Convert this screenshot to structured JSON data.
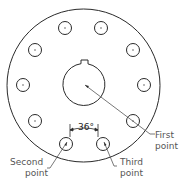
{
  "diagram": {
    "colors": {
      "line": "#2a2a2a",
      "leader": "#555555",
      "text": "#555555",
      "background": "#ffffff"
    },
    "outer_circle": {
      "cx": 83.5,
      "cy": 85.5,
      "r": 76.5
    },
    "center_bore": {
      "cx": 84,
      "cy": 84.5,
      "r": 21,
      "keyway": {
        "x1": 81,
        "x2": 88,
        "top": 60
      }
    },
    "holes": [
      {
        "cx": 65,
        "cy": 28
      },
      {
        "cx": 101,
        "cy": 28
      },
      {
        "cx": 35,
        "cy": 50
      },
      {
        "cx": 133,
        "cy": 50
      },
      {
        "cx": 23,
        "cy": 85
      },
      {
        "cx": 144,
        "cy": 85
      },
      {
        "cx": 35,
        "cy": 121
      },
      {
        "cx": 133,
        "cy": 121
      },
      {
        "cx": 66,
        "cy": 144
      },
      {
        "cx": 103,
        "cy": 144
      }
    ],
    "hole_radius": 6.5,
    "angle_dimension": {
      "label": "36°"
    },
    "callouts": {
      "first": {
        "line1": "First",
        "line2": "point"
      },
      "second": {
        "line1": "Second",
        "line2": "point"
      },
      "third": {
        "line1": "Third",
        "line2": "point"
      }
    }
  }
}
